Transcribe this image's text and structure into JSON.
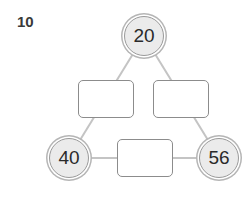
{
  "question_number": "10",
  "circles": {
    "top": "20",
    "bottom_left": "40",
    "bottom_right": "56"
  },
  "boxes": {
    "left": "",
    "right": "",
    "bottom": ""
  }
}
